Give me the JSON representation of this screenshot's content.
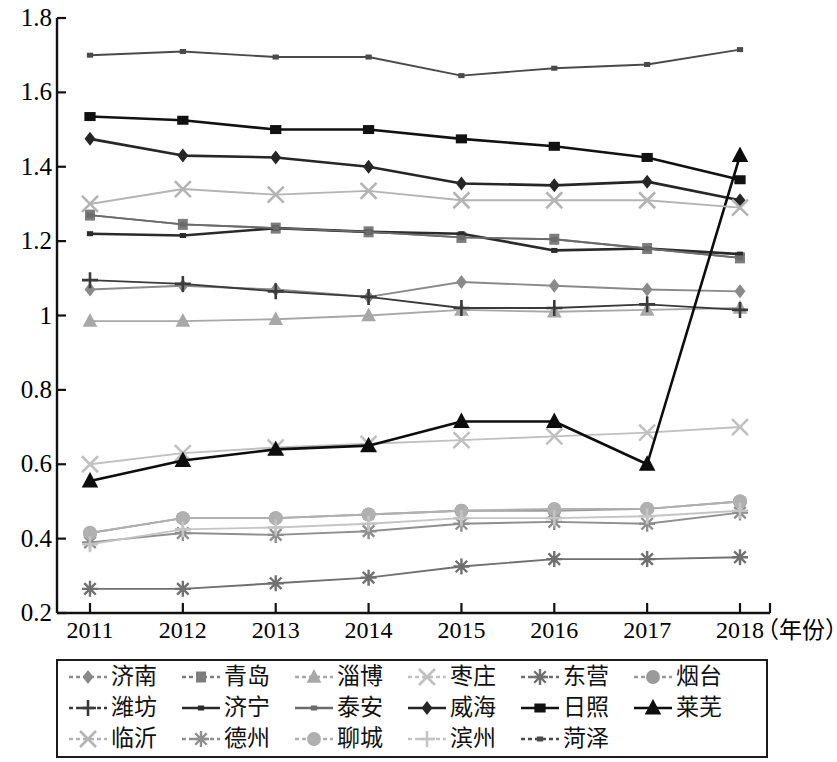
{
  "chart_data": {
    "type": "line",
    "title": "",
    "xlabel": "年份",
    "ylabel": "",
    "xlim": [
      2011,
      2018
    ],
    "ylim": [
      0.2,
      1.8
    ],
    "grid": false,
    "legend_position": "bottom",
    "x": [
      2011,
      2012,
      2013,
      2014,
      2015,
      2016,
      2017,
      2018
    ],
    "categories": [
      "2011",
      "2012",
      "2013",
      "2014",
      "2015",
      "2016",
      "2017",
      "2018"
    ],
    "xtick_labels": [
      "2011",
      "2012",
      "2013",
      "2014",
      "2015",
      "2016",
      "2017",
      "2018"
    ],
    "ytick_labels": [
      "0.2",
      "0.4",
      "0.6",
      "0.8",
      "1",
      "1.2",
      "1.4",
      "1.6",
      "1.8"
    ],
    "ytick_values": [
      0.2,
      0.4,
      0.6,
      0.8,
      1.0,
      1.2,
      1.4,
      1.6,
      1.8
    ],
    "xaxis_unit_label": "（年份）",
    "series": [
      {
        "name": "济南",
        "marker": "diamond",
        "color": "#8a8a8a",
        "values": [
          1.07,
          1.08,
          1.07,
          1.05,
          1.09,
          1.08,
          1.07,
          1.065
        ]
      },
      {
        "name": "青岛",
        "marker": "square",
        "color": "#7d7d7d",
        "values": [
          1.27,
          1.245,
          1.235,
          1.225,
          1.21,
          1.205,
          1.18,
          1.155
        ]
      },
      {
        "name": "淄博",
        "marker": "triangle",
        "color": "#a8a8a8",
        "values": [
          0.985,
          0.985,
          0.99,
          1.0,
          1.015,
          1.01,
          1.015,
          1.02
        ]
      },
      {
        "name": "枣庄",
        "marker": "x",
        "color": "#c0c0c0",
        "values": [
          0.6,
          0.63,
          0.645,
          0.655,
          0.665,
          0.675,
          0.685,
          0.7
        ]
      },
      {
        "name": "东营",
        "marker": "asterisk",
        "color": "#707070",
        "values": [
          0.265,
          0.265,
          0.28,
          0.295,
          0.325,
          0.345,
          0.345,
          0.35
        ]
      },
      {
        "name": "烟台",
        "marker": "circle",
        "color": "#9a9a9a",
        "values": [
          0.415,
          0.455,
          0.455,
          0.465,
          0.475,
          0.475,
          0.48,
          0.5
        ]
      },
      {
        "name": "潍坊",
        "marker": "plus",
        "color": "#3a3a3a",
        "values": [
          1.095,
          1.085,
          1.065,
          1.05,
          1.02,
          1.02,
          1.03,
          1.015
        ]
      },
      {
        "name": "济宁",
        "marker": "small-square",
        "color": "#2a2a2a",
        "values": [
          1.22,
          1.215,
          1.235,
          1.225,
          1.22,
          1.175,
          1.18,
          1.165
        ]
      },
      {
        "name": "泰安",
        "marker": "small-square",
        "color": "#6b6b6b",
        "values": [
          1.27,
          1.245,
          1.235,
          1.225,
          1.21,
          1.205,
          1.18,
          1.155
        ]
      },
      {
        "name": "威海",
        "marker": "diamond",
        "color": "#262626",
        "values": [
          1.475,
          1.43,
          1.425,
          1.4,
          1.355,
          1.35,
          1.36,
          1.31
        ]
      },
      {
        "name": "日照",
        "marker": "filled-square",
        "color": "#111111",
        "values": [
          1.535,
          1.525,
          1.5,
          1.5,
          1.475,
          1.455,
          1.425,
          1.365
        ]
      },
      {
        "name": "莱芜",
        "marker": "filled-triangle",
        "color": "#0d0d0d",
        "values": [
          0.555,
          0.61,
          0.64,
          0.65,
          0.715,
          0.715,
          0.6,
          1.43
        ]
      },
      {
        "name": "临沂",
        "marker": "x",
        "color": "#b4b4b4",
        "values": [
          1.3,
          1.34,
          1.325,
          1.335,
          1.31,
          1.31,
          1.31,
          1.29
        ]
      },
      {
        "name": "德州",
        "marker": "asterisk",
        "color": "#8f8f8f",
        "values": [
          0.39,
          0.415,
          0.41,
          0.42,
          0.44,
          0.445,
          0.44,
          0.47
        ]
      },
      {
        "name": "聊城",
        "marker": "circle",
        "color": "#b0b0b0",
        "values": [
          0.415,
          0.455,
          0.455,
          0.465,
          0.475,
          0.48,
          0.48,
          0.5
        ]
      },
      {
        "name": "滨州",
        "marker": "plus",
        "color": "#c4c4c4",
        "values": [
          0.385,
          0.425,
          0.43,
          0.44,
          0.455,
          0.455,
          0.46,
          0.475
        ]
      },
      {
        "name": "菏泽",
        "marker": "small-square",
        "color": "#4a4a4a",
        "values": [
          1.7,
          1.71,
          1.695,
          1.695,
          1.645,
          1.665,
          1.675,
          1.715
        ]
      }
    ],
    "legend_rows": [
      [
        "济南",
        "青岛",
        "淄博",
        "枣庄",
        "东营",
        "烟台"
      ],
      [
        "潍坊",
        "济宁",
        "泰安",
        "威海",
        "日照",
        "莱芜"
      ],
      [
        "临沂",
        "德州",
        "聊城",
        "滨州",
        "菏泽"
      ]
    ]
  },
  "axis": {
    "color": "#111111"
  }
}
